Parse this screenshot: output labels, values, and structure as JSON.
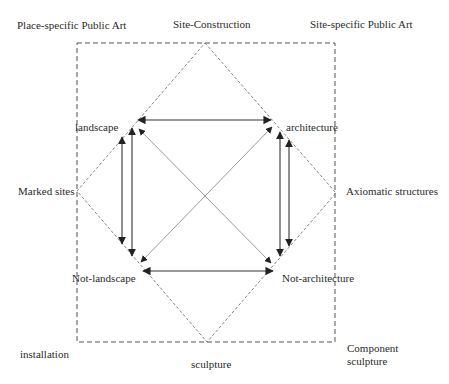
{
  "diagram": {
    "title_cut": "",
    "outer_box": {
      "style": "dashed",
      "x1": 77,
      "y1": 43,
      "x2": 335,
      "y2": 342
    },
    "diamond": {
      "style": "dashed",
      "top": [
        205,
        43
      ],
      "right": [
        336,
        193
      ],
      "bottom": [
        207,
        342
      ],
      "left": [
        77,
        191
      ]
    },
    "corner_labels": {
      "top_left": "Place-specific Public Art",
      "top_center": "Site-Construction",
      "top_right": "Site-specific Public Art",
      "middle_left": "Marked sites",
      "middle_right": "Axiomatic structures",
      "bottom_left": "installation",
      "bottom_center": "sculpture",
      "bottom_right": "Component sculpture"
    },
    "nodes": {
      "landscape": "landscape",
      "architecture": "architecture",
      "not_landscape": "Not-landscape",
      "not_architecture": "Not-architecture"
    },
    "edges": [
      {
        "from": "landscape",
        "to": "architecture",
        "type": "double-arrow",
        "color": "#333333"
      },
      {
        "from": "not_landscape",
        "to": "not_architecture",
        "type": "double-arrow",
        "color": "#333333"
      },
      {
        "from": "landscape",
        "to": "not_landscape",
        "type": "arrow-pair",
        "color": "#333333"
      },
      {
        "from": "architecture",
        "to": "not_architecture",
        "type": "arrow-pair",
        "color": "#333333"
      },
      {
        "from": "landscape",
        "to": "not_architecture",
        "type": "double-arrow",
        "color": "#999999"
      },
      {
        "from": "architecture",
        "to": "not_landscape",
        "type": "double-arrow",
        "color": "#999999"
      }
    ],
    "colors": {
      "dashed_lines": "#555555",
      "solid_arrows": "#333333",
      "diagonal_arrows": "#999999",
      "text": "#2a2a2a"
    }
  }
}
